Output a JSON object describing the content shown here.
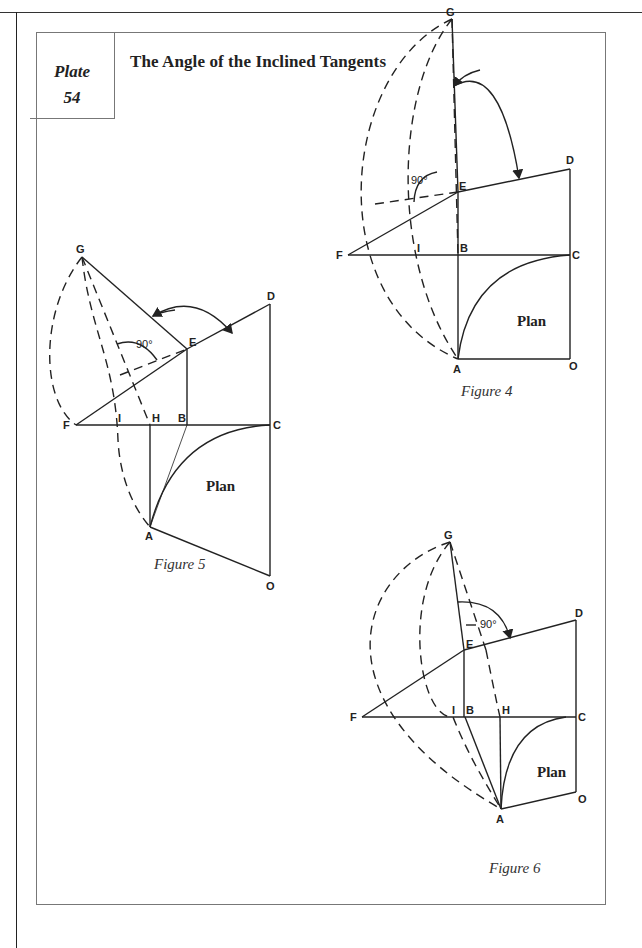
{
  "header": {
    "plate_label": "Plate",
    "plate_number": "54",
    "title": "The Angle of the Inclined Tangents"
  },
  "figures": [
    {
      "caption": "Figure 4",
      "plan_label": "Plan",
      "angle_label": "90°",
      "points": {
        "G": [
          452,
          19
        ],
        "E": [
          458,
          192
        ],
        "D": [
          570,
          169
        ],
        "F": [
          348,
          255
        ],
        "I": [
          418,
          255
        ],
        "B": [
          458,
          255
        ],
        "C": [
          570,
          255
        ],
        "A": [
          458,
          359
        ],
        "O": [
          570,
          359
        ]
      },
      "labels": [
        "G",
        "E",
        "D",
        "F",
        "I",
        "B",
        "C",
        "A",
        "O"
      ]
    },
    {
      "caption": "Figure 5",
      "plan_label": "Plan",
      "angle_label": "90°",
      "points": {
        "G": [
          82,
          257
        ],
        "E": [
          187,
          349
        ],
        "D": [
          270,
          304
        ],
        "F": [
          76,
          425
        ],
        "I": [
          118,
          425
        ],
        "H": [
          150,
          425
        ],
        "B": [
          187,
          425
        ],
        "C": [
          270,
          425
        ],
        "A": [
          150,
          527
        ],
        "O": [
          270,
          576
        ]
      },
      "labels": [
        "G",
        "E",
        "D",
        "F",
        "I",
        "H",
        "B",
        "C",
        "A",
        "O"
      ]
    },
    {
      "caption": "Figure 6",
      "plan_label": "Plan",
      "angle_label": "90°",
      "points": {
        "G": [
          450,
          542
        ],
        "E": [
          464,
          650
        ],
        "D": [
          576,
          620
        ],
        "F": [
          362,
          717
        ],
        "I": [
          453,
          717
        ],
        "B": [
          465,
          717
        ],
        "H": [
          500,
          717
        ],
        "C": [
          576,
          717
        ],
        "A": [
          501,
          809
        ],
        "O": [
          576,
          792
        ]
      },
      "labels": [
        "G",
        "E",
        "D",
        "F",
        "I",
        "B",
        "H",
        "C",
        "A",
        "O"
      ]
    }
  ]
}
